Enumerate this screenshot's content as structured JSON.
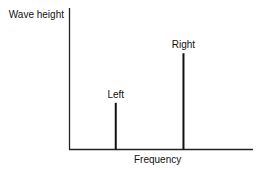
{
  "chart_data": {
    "type": "bar",
    "title": "",
    "ylabel": "Wave height",
    "xlabel": "Frequency",
    "x_range": [
      0,
      1
    ],
    "y_range": [
      0,
      1
    ],
    "grid": false,
    "axis_ticks": false,
    "categories": [
      "Left",
      "Right"
    ],
    "x": [
      0.25,
      0.62
    ],
    "values": [
      0.33,
      0.68
    ],
    "bar_style": "vertical-line",
    "colors": {
      "axis": "#222222",
      "bar": "#111111",
      "text": "#111111"
    }
  }
}
